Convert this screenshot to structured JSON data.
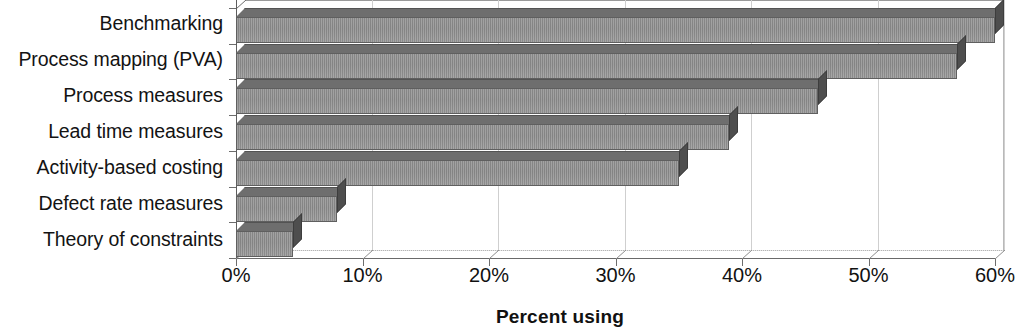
{
  "chart_data": {
    "type": "bar",
    "orientation": "horizontal",
    "title": "",
    "xlabel": "Percent using",
    "ylabel": "",
    "categories": [
      "Benchmarking",
      "Process mapping (PVA)",
      "Process measures",
      "Lead time measures",
      "Activity-based costing",
      "Defect rate measures",
      "Theory of constraints"
    ],
    "values": [
      60,
      57,
      46,
      39,
      35,
      8,
      4.5
    ],
    "value_suffix": "%",
    "xlim": [
      0,
      60
    ],
    "xticks": [
      0,
      10,
      20,
      30,
      40,
      50,
      60
    ],
    "xticklabels": [
      "0%",
      "10%",
      "20%",
      "30%",
      "40%",
      "50%",
      "60%"
    ],
    "grid": true,
    "grid_axis": "x",
    "legend": false,
    "style": "3d-grayscale",
    "bar_color": "#8e8e8e",
    "bar_top_color": "#6e6e6e",
    "bar_cap_color": "#4e4e4e",
    "axis_color": "#6a6a6a",
    "grid_color": "#cfcfcf",
    "text_color": "#111111",
    "background": "#ffffff"
  }
}
